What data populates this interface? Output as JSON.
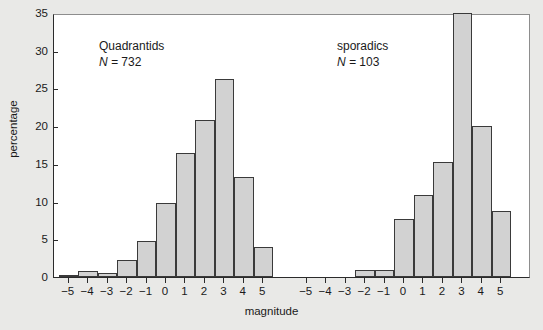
{
  "chart_data": {
    "type": "bar",
    "title": "",
    "subtitle": "",
    "xlabel": "magnitude",
    "ylabel": "percentage",
    "ylim": [
      0,
      35
    ],
    "yticks": [
      0,
      5,
      10,
      15,
      20,
      25,
      30,
      35
    ],
    "grid": false,
    "legend_position": "none",
    "bar_fill_color": "#d2d2d2",
    "bar_edge_color": "#3a3a3a",
    "background_color": "#e9e9e7",
    "plot_background_color": "#ffffff",
    "panels": [
      {
        "name": "Quadrantids",
        "label": "Quadrantids",
        "count_label": "N =",
        "count_value": "732",
        "xlabel": "magnitude",
        "xticks": [
          -5,
          -4,
          -3,
          -2,
          -1,
          0,
          1,
          2,
          3,
          4,
          5
        ],
        "xtick_labels": [
          "−5",
          "−4",
          "−3",
          "−2",
          "−1",
          "0",
          "1",
          "2",
          "3",
          "4",
          "5"
        ],
        "categories": [
          -5,
          -4,
          -3,
          -2,
          -1,
          0,
          1,
          2,
          3,
          4,
          5
        ],
        "values": [
          0.3,
          0.8,
          0.5,
          2.2,
          4.8,
          9.8,
          16.4,
          20.8,
          26.3,
          13.2,
          4.0
        ]
      },
      {
        "name": "sporadics",
        "label": "sporadics",
        "count_label": "N =",
        "count_value": "103",
        "xlabel": "magnitude",
        "xticks": [
          -5,
          -4,
          -3,
          -2,
          -1,
          0,
          1,
          2,
          3,
          4,
          5
        ],
        "xtick_labels": [
          "−5",
          "−4",
          "−3",
          "−2",
          "−1",
          "0",
          "1",
          "2",
          "3",
          "4",
          "5"
        ],
        "categories": [
          -5,
          -4,
          -3,
          -2,
          -1,
          0,
          1,
          2,
          3,
          4,
          5
        ],
        "values": [
          0,
          0,
          0,
          0.9,
          0.9,
          7.7,
          10.9,
          15.3,
          35.0,
          20.0,
          8.7
        ]
      }
    ]
  }
}
